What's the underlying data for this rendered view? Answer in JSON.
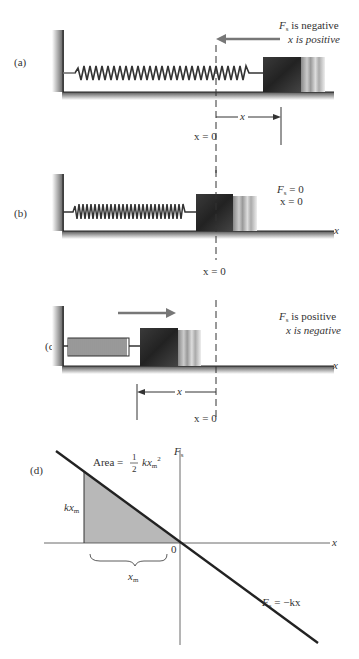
{
  "header": {
    "fragment": "7.3 · Work Done by a Varying Force"
  },
  "panels": {
    "a": {
      "label": "(a)",
      "note_line1": "F",
      "note_line1_sub": "s",
      "note_line1_rest": " is negative",
      "note_line2": "x is positive",
      "x_zero": "x = 0",
      "x_disp": "x"
    },
    "b": {
      "label": "(b)",
      "note_line1": "F",
      "note_line1_sub": "s",
      "note_line1_rest": " = 0",
      "note_line2": "x = 0",
      "x_zero": "x = 0",
      "axis": "x"
    },
    "c": {
      "label": "(c)",
      "note_line1": "F",
      "note_line1_sub": "s",
      "note_line1_rest": " is positive",
      "note_line2": "x is negative",
      "x_zero": "x = 0",
      "x_disp": "x",
      "axis": "x"
    },
    "d": {
      "label": "(d)",
      "y_axis": "F",
      "y_axis_sub": "s",
      "x_axis": "x",
      "origin": "0",
      "area_label": "Area = ",
      "area_frac_num": "1",
      "area_frac_den": "2",
      "area_expr": "kx",
      "area_sub": "m",
      "area_sup": "2",
      "height_label": "kx",
      "height_sub": "m",
      "width_label": "x",
      "width_sub": "m",
      "line_label": "F",
      "line_label_sub": "s",
      "line_label_rest": " = −kx"
    }
  },
  "colors": {
    "ink": "#333333",
    "arrow": "#777777",
    "block_dark": "#2e2e2e",
    "shade": "#b8b8b8"
  }
}
